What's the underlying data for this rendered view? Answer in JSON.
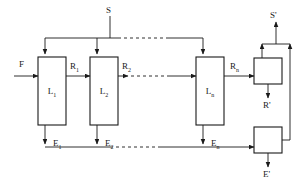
{
  "diagram": {
    "colors": {
      "line": "#1a1a1a",
      "background": "#ffffff",
      "box_fill": "#ffffff"
    },
    "stages": [
      {
        "id": "stage-1",
        "label": "L",
        "subscript": "1"
      },
      {
        "id": "stage-2",
        "label": "L",
        "subscript": "2"
      },
      {
        "id": "stage-n",
        "label": "L",
        "subscript": "n"
      }
    ],
    "collectors": [
      {
        "id": "collector-raffinate",
        "label": ""
      },
      {
        "id": "collector-extract",
        "label": ""
      }
    ],
    "streams": {
      "feed": {
        "label": "F",
        "subscript": ""
      },
      "solvent": {
        "label": "S",
        "subscript": ""
      },
      "solvent_out": {
        "label": "S'",
        "subscript": ""
      },
      "raffinate_out": {
        "label": "R'",
        "subscript": ""
      },
      "extract_out": {
        "label": "E'",
        "subscript": ""
      },
      "raffinates": [
        {
          "label": "R",
          "subscript": "1"
        },
        {
          "label": "R",
          "subscript": "2"
        },
        {
          "label": "R",
          "subscript": "n"
        }
      ],
      "extracts": [
        {
          "label": "E",
          "subscript": "1"
        },
        {
          "label": "E",
          "subscript": "2"
        },
        {
          "label": "E",
          "subscript": "n"
        }
      ]
    }
  }
}
